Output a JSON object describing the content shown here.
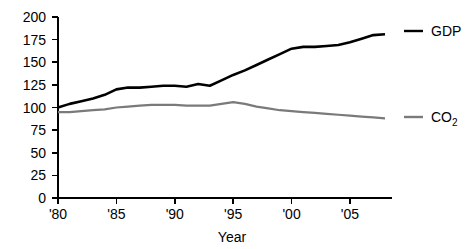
{
  "chart_data": {
    "type": "line",
    "title": "",
    "xlabel": "Year",
    "ylabel": "",
    "xlim": [
      1980,
      2008
    ],
    "ylim": [
      0,
      200
    ],
    "grid": false,
    "legend_position": "right",
    "x_tick_labels": [
      "'80",
      "'85",
      "'90",
      "'95",
      "'00",
      "'05"
    ],
    "x_tick_values": [
      1980,
      1985,
      1990,
      1995,
      2000,
      2005
    ],
    "y_tick_labels": [
      "0",
      "25",
      "50",
      "75",
      "100",
      "125",
      "150",
      "175",
      "200"
    ],
    "y_tick_values": [
      0,
      25,
      50,
      75,
      100,
      125,
      150,
      175,
      200
    ],
    "x": [
      1980,
      1981,
      1982,
      1983,
      1984,
      1985,
      1986,
      1987,
      1988,
      1989,
      1990,
      1991,
      1992,
      1993,
      1994,
      1995,
      1996,
      1997,
      1998,
      1999,
      2000,
      2001,
      2002,
      2003,
      2004,
      2005,
      2006,
      2007,
      2008
    ],
    "series": [
      {
        "name": "GDP",
        "color": "#000000",
        "values": [
          100,
          104,
          107,
          110,
          114,
          120,
          122,
          122,
          123,
          124,
          124,
          123,
          126,
          124,
          130,
          136,
          141,
          147,
          153,
          159,
          165,
          167,
          167,
          168,
          169,
          172,
          176,
          180,
          181
        ]
      },
      {
        "name": "CO2",
        "color": "#7a7a7a",
        "values": [
          95,
          95,
          96,
          97,
          98,
          100,
          101,
          102,
          103,
          103,
          103,
          102,
          102,
          102,
          104,
          106,
          104,
          101,
          99,
          97,
          96,
          95,
          94,
          93,
          92,
          91,
          90,
          89,
          88
        ]
      }
    ],
    "legend": [
      {
        "label": "GDP",
        "sublabel": "",
        "color": "#000000"
      },
      {
        "label": "CO",
        "sublabel": "2",
        "color": "#7a7a7a"
      }
    ]
  }
}
